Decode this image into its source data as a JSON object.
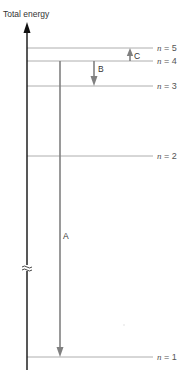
{
  "title": "Total energy",
  "levels": [
    {
      "n": "5",
      "label_var": "n",
      "label_eq": " = 5"
    },
    {
      "n": "4",
      "label_var": "n",
      "label_eq": " = 4"
    },
    {
      "n": "3",
      "label_var": "n",
      "label_eq": " = 3"
    },
    {
      "n": "2",
      "label_var": "n",
      "label_eq": " = 2"
    },
    {
      "n": "1",
      "label_var": "n",
      "label_eq": " = 1"
    }
  ],
  "transitions": [
    {
      "label": "A",
      "from": "n = 4",
      "to": "n = 1",
      "direction": "down"
    },
    {
      "label": "B",
      "from": "n = 4",
      "to": "n = 3",
      "direction": "down"
    },
    {
      "label": "C",
      "from": "n = 4",
      "to": "n = 5",
      "direction": "up"
    }
  ],
  "axis_break_symbol": "≈",
  "colors": {
    "axis": "#111111",
    "level_line": "#9a9a9a",
    "arrow": "#808080",
    "text": "#333333"
  }
}
